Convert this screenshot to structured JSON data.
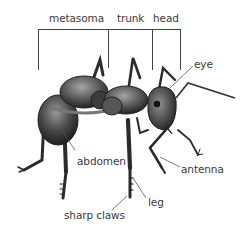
{
  "diagram": {
    "subject": "ant",
    "colors": {
      "background": "#ffffff",
      "label_text": "#3a3a3a",
      "leader_line": "#555555",
      "bracket_line": "#444444",
      "body_dark": "#2b2b2b",
      "body_mid": "#6e6e6e",
      "body_light": "#b8b8b8"
    },
    "section_labels": {
      "metasoma": "metasoma",
      "trunk": "trunk",
      "head": "head"
    },
    "part_labels": {
      "eye": "eye",
      "abdomen": "abdomen",
      "antenna": "antenna",
      "leg": "leg",
      "sharp_claws": "sharp claws"
    }
  }
}
